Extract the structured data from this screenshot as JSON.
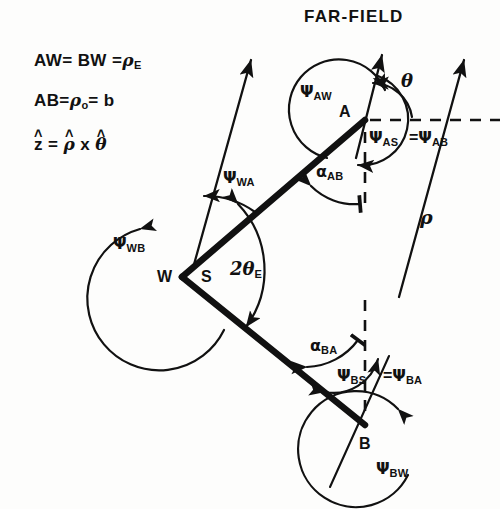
{
  "figure": {
    "title": "FAR-FIELD",
    "background_color": "#fdfdfc",
    "ink_color": "#111111"
  },
  "legend": {
    "line1": {
      "lhs": "AW= BW =",
      "sym": "ρ",
      "sub": "E"
    },
    "line2": {
      "lhs": "AB=",
      "sym": "ρ",
      "sub": "o",
      "rhs": "= b"
    },
    "line3": {
      "z": "z",
      "eq": "=",
      "rho": "ρ",
      "times": "x",
      "theta": "θ",
      "hat": "˄"
    }
  },
  "vertices": [
    {
      "name": "A",
      "label": "A",
      "x": 365,
      "y": 120
    },
    {
      "name": "B",
      "label": "B",
      "x": 365,
      "y": 425
    },
    {
      "name": "W",
      "label": "W",
      "x": 182,
      "y": 277
    },
    {
      "name": "S",
      "label": "S",
      "x": 207,
      "y": 277
    }
  ],
  "angles": [
    {
      "id": "psi-aw",
      "sym": "Ψ",
      "sub": "AW",
      "x": 300,
      "y": 92
    },
    {
      "id": "theta-a",
      "sym": "θ",
      "sub": "",
      "x": 405,
      "y": 84
    },
    {
      "id": "psi-as",
      "sym": "Ψ",
      "sub": "AS",
      "x": 372,
      "y": 137
    },
    {
      "id": "psi-ab",
      "sym": "Ψ",
      "sub": "AB",
      "x": 414,
      "y": 137,
      "prefix": "="
    },
    {
      "id": "alpha-ab",
      "sym": "α",
      "sub": "AB",
      "x": 318,
      "y": 172
    },
    {
      "id": "psi-wa",
      "sym": "Ψ",
      "sub": "WA",
      "x": 222,
      "y": 177
    },
    {
      "id": "psi-wb",
      "sym": "Ψ",
      "sub": "WB",
      "x": 114,
      "y": 243
    },
    {
      "id": "two-theta-e",
      "sym": "2θ",
      "sub": "E",
      "x": 232,
      "y": 268
    },
    {
      "id": "alpha-ba",
      "sym": "α",
      "sub": "BA",
      "x": 312,
      "y": 345
    },
    {
      "id": "psi-bs",
      "sym": "Ψ",
      "sub": "BS",
      "x": 340,
      "y": 375
    },
    {
      "id": "psi-ba",
      "sym": "Ψ",
      "sub": "BA",
      "x": 388,
      "y": 375,
      "prefix": "="
    },
    {
      "id": "psi-bw",
      "sym": "Ψ",
      "sub": "BW",
      "x": 378,
      "y": 468
    },
    {
      "id": "rho-ray",
      "sym": "ρ",
      "sub": "",
      "x": 423,
      "y": 218
    }
  ],
  "rays": [
    {
      "name": "far-field-ray-from-W",
      "from": [
        193,
        265
      ],
      "to": [
        250,
        55
      ]
    },
    {
      "name": "far-field-ray-from-A",
      "from": [
        358,
        152
      ],
      "to": [
        383,
        50
      ]
    },
    {
      "name": "far-field-ray-from-B",
      "from": [
        399,
        300
      ],
      "to": [
        465,
        55
      ]
    },
    {
      "name": "rho-ray-lower",
      "from": [
        330,
        487
      ],
      "to": [
        388,
        355
      ]
    }
  ],
  "segments": [
    {
      "name": "segment-WA",
      "from": [
        182,
        277
      ],
      "to": [
        365,
        120
      ]
    },
    {
      "name": "segment-WB",
      "from": [
        182,
        277
      ],
      "to": [
        365,
        425
      ]
    }
  ],
  "dashed": [
    {
      "name": "horizontal-dashed-through-A",
      "from": [
        368,
        120
      ],
      "to": [
        500,
        120
      ]
    },
    {
      "name": "vertical-dashed-below-A",
      "from": [
        365,
        130
      ],
      "to": [
        365,
        210
      ]
    },
    {
      "name": "vertical-dashed-above-B",
      "from": [
        365,
        300
      ],
      "to": [
        365,
        415
      ]
    }
  ]
}
